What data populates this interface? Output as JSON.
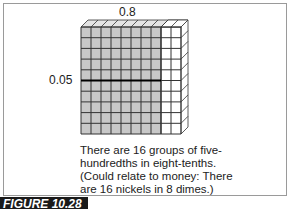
{
  "figure": {
    "top_label": "0.8",
    "left_label": "0.05",
    "caption_lines": [
      "There are 16 groups of five-",
      "hundredths in eight-tenths.",
      "(Could relate to money: There",
      "are 16 nickels in 8 dimes.)"
    ],
    "figure_tag": "FIGURE 10.28",
    "grid": {
      "columns": 10,
      "rows": 10,
      "shaded_columns": 8,
      "divider_after_row": 5,
      "shaded_color": "#c8c8c8",
      "unshaded_color": "#ffffff",
      "line_color": "#333333"
    }
  }
}
